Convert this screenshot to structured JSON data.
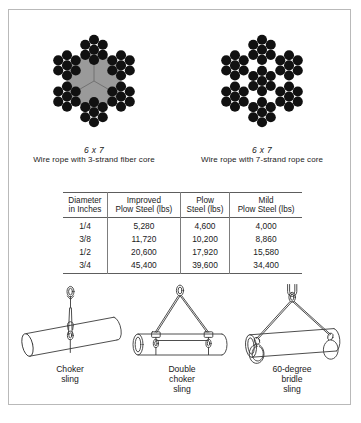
{
  "figures": [
    {
      "id": "wire-rope-fiber-core",
      "spec": "6 x 7",
      "desc": "Wire rope with 3-strand fiber core",
      "strands": 6,
      "wires_per_strand": 7,
      "core": "3-strand fiber core",
      "core_color": "#9a9a9a",
      "wire_color": "#111111"
    },
    {
      "id": "wire-rope-rope-core",
      "spec": "6 x 7",
      "desc": "Wire rope with 7-strand rope core",
      "strands": 6,
      "wires_per_strand": 7,
      "core": "7-strand rope core",
      "core_color": "#111111",
      "wire_color": "#111111"
    }
  ],
  "table": {
    "headers": [
      "Diameter\nin Inches",
      "Improved\nPlow Steel (lbs)",
      "Plow\nSteel (lbs)",
      "Mild\nPlow Steel (lbs)"
    ],
    "headers_lines": [
      [
        "Diameter",
        "in Inches"
      ],
      [
        "Improved",
        "Plow Steel (lbs)"
      ],
      [
        "Plow",
        "Steel (lbs)"
      ],
      [
        "Mild",
        "Plow Steel (lbs)"
      ]
    ],
    "rows": [
      [
        "1/4",
        "5,280",
        "4,600",
        "4,000"
      ],
      [
        "3/8",
        "11,720",
        "10,200",
        "8,860"
      ],
      [
        "1/2",
        "20,600",
        "17,920",
        "15,580"
      ],
      [
        "3/4",
        "45,400",
        "39,600",
        "34,400"
      ]
    ]
  },
  "slings": [
    {
      "id": "choker-sling",
      "label_lines": [
        "Choker",
        "sling"
      ]
    },
    {
      "id": "double-choker-sling",
      "label_lines": [
        "Double",
        "choker",
        "sling"
      ]
    },
    {
      "id": "bridle-sling-60",
      "label_lines": [
        "60-degree",
        "bridle",
        "sling"
      ]
    }
  ],
  "colors": {
    "border": "#b9b9b9",
    "rule": "#5d5d5d",
    "divider": "#7d7d7d",
    "line_art": "#3a3a3a",
    "text": "#1a1a1a"
  }
}
